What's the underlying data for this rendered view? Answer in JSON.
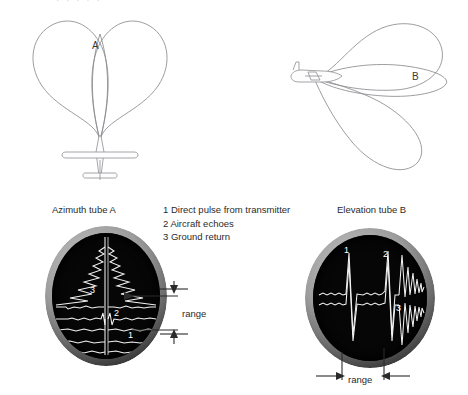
{
  "figure": {
    "type": "technical-diagram",
    "partial_top_text": "· · · · ·"
  },
  "diagrams": {
    "azimuth": {
      "caption": "Azimuth tube A",
      "lobe_letter": "A",
      "lobe_count": 2,
      "view": "plan view of aircraft with two forward squinted beams overlapping on the boresight"
    },
    "elevation": {
      "caption": "Elevation tube B",
      "lobe_letter": "B",
      "lobe_count": 3,
      "view": "side view of aircraft with upper, centre and lower beams"
    }
  },
  "legend": {
    "items": [
      "1 Direct pulse from transmitter",
      "2 Aircraft echoes",
      "3 Ground return"
    ]
  },
  "tube_a": {
    "name": "Azimuth tube A",
    "markers": [
      "3",
      "2",
      "1"
    ],
    "range_label": "range",
    "trace_description": "vertical time base with left and right deflection traces; jagged ground return at top, aircraft echo pip at centre, direct transmitter pulse near bottom"
  },
  "tube_b": {
    "name": "Elevation tube B",
    "markers": [
      "1",
      "2",
      "3"
    ],
    "range_label": "range",
    "trace_description": "horizontal time base with upper and lower deflection traces; direct pulse spike, aircraft echo spike, decaying ground return to the right"
  },
  "colors": {
    "background": "#ffffff",
    "text": "#2b2b2b",
    "lobe_stroke": "#8b8b90",
    "crt_screen": "#060606",
    "crt_trace": "#f2f2f2",
    "annotation": "#2a2a2a"
  }
}
